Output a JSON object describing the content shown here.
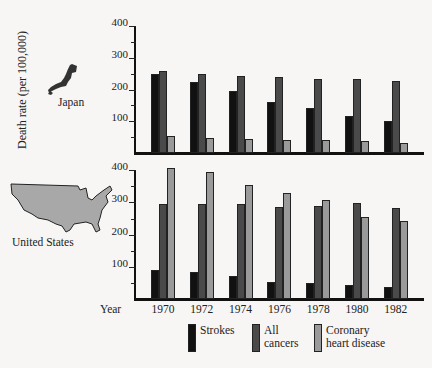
{
  "chart_data": {
    "type": "bar",
    "title": "",
    "ylabel": "Death rate (per 100,000)",
    "xlabel": "Year",
    "categories": [
      "1970",
      "1972",
      "1974",
      "1976",
      "1978",
      "1980",
      "1982"
    ],
    "ylim": [
      0,
      400
    ],
    "yticks": [
      100,
      200,
      300,
      400
    ],
    "grid": false,
    "legend_position": "bottom",
    "panels": [
      {
        "name": "Japan",
        "series": [
          {
            "name": "Strokes",
            "color": "#111111",
            "values": [
              250,
              223,
              194,
              161,
              143,
              118,
              101
            ]
          },
          {
            "name": "All cancers",
            "color": "#4a4a4a",
            "values": [
              257,
              249,
              242,
              238,
              234,
              233,
              228
            ]
          },
          {
            "name": "Coronary heart disease",
            "color": "#9a9a9a",
            "values": [
              55,
              47,
              44,
              41,
              41,
              38,
              30
            ]
          }
        ]
      },
      {
        "name": "United States",
        "series": [
          {
            "name": "Strokes",
            "color": "#111111",
            "values": [
              92,
              86,
              72,
              54,
              51,
              44,
              40
            ]
          },
          {
            "name": "All cancers",
            "color": "#4a4a4a",
            "values": [
              295,
              295,
              295,
              287,
              289,
              297,
              283
            ]
          },
          {
            "name": "Coronary heart disease",
            "color": "#9a9a9a",
            "values": [
              407,
              393,
              354,
              328,
              307,
              254,
              244
            ]
          }
        ]
      }
    ]
  },
  "labels": {
    "ylabel": "Death rate (per 100,000)",
    "year": "Year",
    "japan": "Japan",
    "us": "United States",
    "ticks": [
      "400",
      "300",
      "200",
      "100"
    ],
    "years": [
      "1970",
      "1972",
      "1974",
      "1976",
      "1978",
      "1980",
      "1982"
    ]
  },
  "legend": [
    {
      "label_line1": "Strokes",
      "label_line2": "",
      "color": "#111111"
    },
    {
      "label_line1": "All",
      "label_line2": "cancers",
      "color": "#4a4a4a"
    },
    {
      "label_line1": "Coronary",
      "label_line2": "heart disease",
      "color": "#9a9a9a"
    }
  ]
}
